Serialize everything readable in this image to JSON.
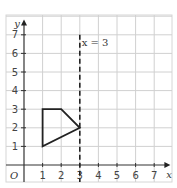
{
  "chart_data": {
    "type": "line",
    "title": "",
    "xlabel": "x",
    "ylabel": "y",
    "xlim": [
      0,
      7
    ],
    "ylim": [
      0,
      7
    ],
    "grid": true,
    "origin_label": "O",
    "x_ticks": [
      "1",
      "2",
      "3",
      "4",
      "5",
      "6",
      "7"
    ],
    "y_ticks": [
      "1",
      "2",
      "3",
      "4",
      "5",
      "6",
      "7"
    ],
    "series": [
      {
        "name": "shape",
        "kind": "polygon",
        "points": [
          [
            1,
            1
          ],
          [
            1,
            3
          ],
          [
            2,
            3
          ],
          [
            3,
            2
          ]
        ]
      }
    ],
    "annotations": [
      {
        "type": "vertical-dashed-line",
        "x": 3,
        "label": "x = 3",
        "label_pos": [
          3.1,
          6.6
        ]
      }
    ]
  }
}
